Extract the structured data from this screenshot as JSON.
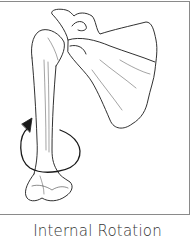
{
  "figure": {
    "caption": "Internal Rotation",
    "annotation": "rotation-arrow",
    "colors": {
      "line": "#1a1a1a",
      "frame": "#8a8a8a",
      "caption": "#333333"
    }
  }
}
